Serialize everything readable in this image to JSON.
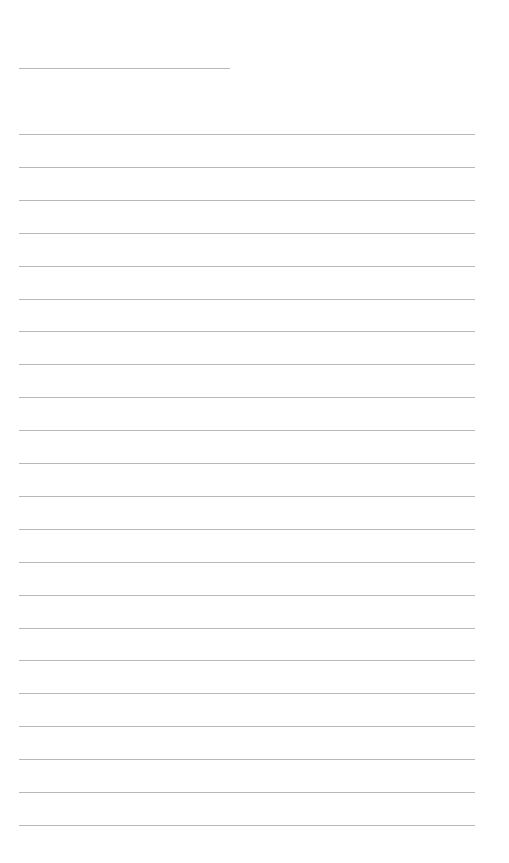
{
  "page": {
    "background": "#ffffff",
    "line_color": "#b8b8b8",
    "title_line": {
      "top": 68,
      "left": 19,
      "width": 211
    },
    "ruled_lines": {
      "count": 22,
      "first_top": 134,
      "spacing": 32.9,
      "left": 19,
      "width": 456
    }
  }
}
